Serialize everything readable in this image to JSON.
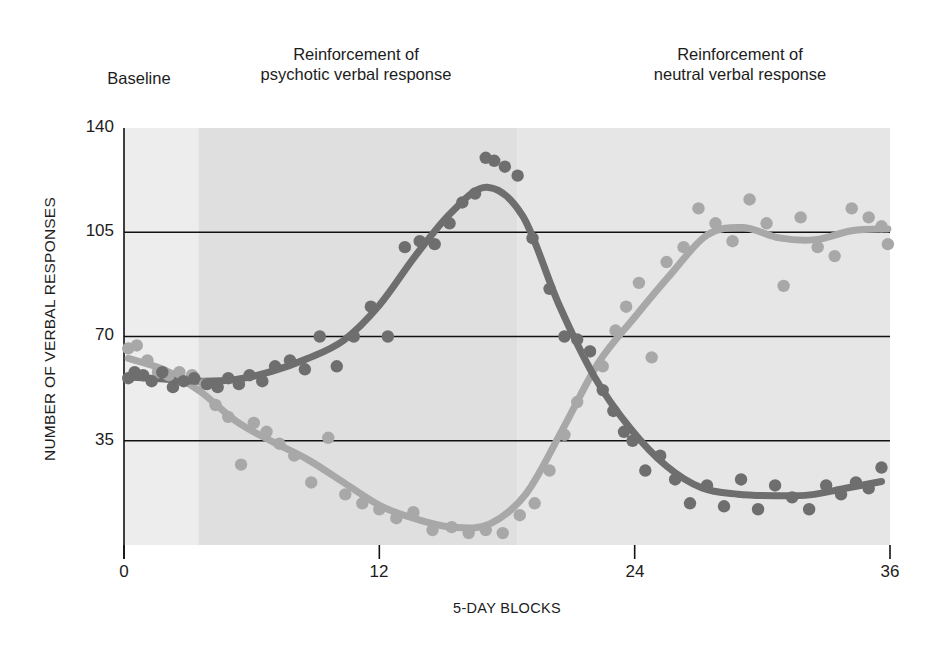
{
  "axes": {
    "ylabel": "NUMBER OF VERBAL RESPONSES",
    "xlabel": "5-DAY BLOCKS",
    "yticks": [
      "140",
      "105",
      "70",
      "35"
    ],
    "xticks": [
      "0",
      "12",
      "24",
      "36"
    ]
  },
  "phases": {
    "baseline": "Baseline",
    "psychotic": "Reinforcement of\npsychotic verbal response",
    "neutral": "Reinforcement of\nneutral verbal response"
  },
  "legend": {
    "neutral": "Neutral verbal\nresponse",
    "psychotic": "Psychotic verbal\nresponse"
  },
  "colors": {
    "neutral": "#a8a8a8",
    "psychotic": "#6e6e6e",
    "baseline_band": "#ededed",
    "psychotic_band": "#dfdfdf",
    "neutral_band": "#e6e6e6",
    "gridline": "#111111"
  },
  "chart_data": {
    "type": "scatter",
    "title": "",
    "xlabel": "5-DAY BLOCKS",
    "ylabel": "NUMBER OF VERBAL RESPONSES",
    "xlim": [
      0,
      36
    ],
    "ylim": [
      0,
      140
    ],
    "xticks": [
      0,
      12,
      24,
      36
    ],
    "yticks": [
      35,
      70,
      105,
      140
    ],
    "gridlines_y": [
      35,
      70,
      105
    ],
    "grid": "horizontal-only",
    "legend_position": "top-left-inside",
    "phase_boundaries": [
      3.5,
      18.5
    ],
    "phase_names": [
      "Baseline",
      "Reinforcement of psychotic verbal response",
      "Reinforcement of neutral verbal response"
    ],
    "series": [
      {
        "name": "Neutral verbal response",
        "color": "#a8a8a8",
        "points": [
          [
            0.2,
            66
          ],
          [
            0.6,
            67
          ],
          [
            1.1,
            62
          ],
          [
            1.6,
            58
          ],
          [
            2.1,
            57
          ],
          [
            2.6,
            58
          ],
          [
            3.2,
            57
          ],
          [
            3.8,
            54
          ],
          [
            4.3,
            47
          ],
          [
            4.9,
            43
          ],
          [
            5.5,
            27
          ],
          [
            6.1,
            41
          ],
          [
            6.7,
            38
          ],
          [
            7.3,
            34
          ],
          [
            8.0,
            30
          ],
          [
            8.8,
            21
          ],
          [
            9.6,
            36
          ],
          [
            10.4,
            17
          ],
          [
            11.2,
            14
          ],
          [
            12.0,
            12
          ],
          [
            12.8,
            9
          ],
          [
            13.6,
            11
          ],
          [
            14.5,
            5
          ],
          [
            15.4,
            6
          ],
          [
            16.2,
            4
          ],
          [
            17.0,
            5
          ],
          [
            17.8,
            4
          ],
          [
            18.6,
            10
          ],
          [
            19.3,
            14
          ],
          [
            20.0,
            25
          ],
          [
            20.7,
            37
          ],
          [
            21.3,
            48
          ],
          [
            21.9,
            65
          ],
          [
            22.5,
            60
          ],
          [
            23.1,
            72
          ],
          [
            23.6,
            80
          ],
          [
            24.2,
            88
          ],
          [
            24.8,
            63
          ],
          [
            25.5,
            95
          ],
          [
            26.3,
            100
          ],
          [
            27.0,
            113
          ],
          [
            27.8,
            108
          ],
          [
            28.6,
            102
          ],
          [
            29.4,
            116
          ],
          [
            30.2,
            108
          ],
          [
            31.0,
            87
          ],
          [
            31.8,
            110
          ],
          [
            32.6,
            100
          ],
          [
            33.4,
            97
          ],
          [
            34.2,
            113
          ],
          [
            35.0,
            110
          ],
          [
            35.6,
            107
          ],
          [
            35.9,
            101
          ]
        ]
      },
      {
        "name": "Psychotic verbal response",
        "color": "#6e6e6e",
        "points": [
          [
            0.2,
            56
          ],
          [
            0.5,
            58
          ],
          [
            0.9,
            57
          ],
          [
            1.3,
            55
          ],
          [
            1.8,
            58
          ],
          [
            2.3,
            53
          ],
          [
            2.8,
            55
          ],
          [
            3.3,
            56
          ],
          [
            3.9,
            54
          ],
          [
            4.4,
            53
          ],
          [
            4.9,
            56
          ],
          [
            5.4,
            54
          ],
          [
            5.9,
            57
          ],
          [
            6.5,
            55
          ],
          [
            7.1,
            60
          ],
          [
            7.8,
            62
          ],
          [
            8.5,
            59
          ],
          [
            9.2,
            70
          ],
          [
            10.0,
            60
          ],
          [
            10.8,
            70
          ],
          [
            11.6,
            80
          ],
          [
            12.4,
            70
          ],
          [
            13.2,
            100
          ],
          [
            13.9,
            102
          ],
          [
            14.6,
            101
          ],
          [
            15.3,
            108
          ],
          [
            15.9,
            115
          ],
          [
            16.5,
            118
          ],
          [
            17.0,
            130
          ],
          [
            17.4,
            129
          ],
          [
            17.9,
            127
          ],
          [
            18.5,
            124
          ],
          [
            19.2,
            103
          ],
          [
            20.0,
            86
          ],
          [
            20.7,
            70
          ],
          [
            21.3,
            69
          ],
          [
            21.9,
            65
          ],
          [
            22.5,
            52
          ],
          [
            23.0,
            45
          ],
          [
            23.5,
            38
          ],
          [
            23.9,
            35
          ],
          [
            24.5,
            25
          ],
          [
            25.2,
            30
          ],
          [
            25.9,
            22
          ],
          [
            26.6,
            14
          ],
          [
            27.4,
            20
          ],
          [
            28.2,
            13
          ],
          [
            29.0,
            22
          ],
          [
            29.8,
            12
          ],
          [
            30.6,
            20
          ],
          [
            31.4,
            16
          ],
          [
            32.2,
            12
          ],
          [
            33.0,
            20
          ],
          [
            33.7,
            17
          ],
          [
            34.4,
            21
          ],
          [
            35.0,
            19
          ],
          [
            35.6,
            26
          ]
        ]
      }
    ],
    "fitted_curves": [
      {
        "name": "Neutral verbal response",
        "description": "Starts ~66, declines to minimum ~8 near block 16, rises steeply to plateau ~110 after block 24"
      },
      {
        "name": "Psychotic verbal response",
        "description": "Flat ~55 through baseline, rises to peak ~130 at block 17, falls sharply to plateau ~18 after block 25"
      }
    ]
  }
}
